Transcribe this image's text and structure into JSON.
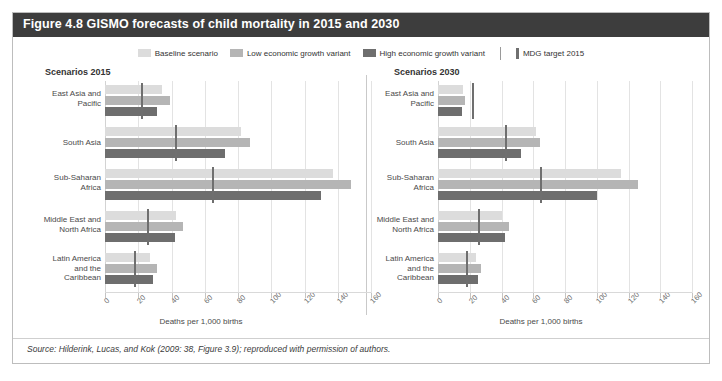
{
  "figure": {
    "title": "Figure 4.8 GISMO forecasts of child mortality in 2015 and 2030",
    "source": "Source: Hilderink, Lucas, and Kok (2009: 38, Figure 3.9); reproduced with permission of authors.",
    "title_bar_color": "#3d3d3d"
  },
  "legend": {
    "items": [
      {
        "label": "Baseline scenario",
        "color": "#dcdcdc",
        "type": "swatch"
      },
      {
        "label": "Low economic growth variant",
        "color": "#b5b5b5",
        "type": "swatch"
      },
      {
        "label": "High economic growth variant",
        "color": "#6e6e6e",
        "type": "swatch"
      },
      {
        "label": "MDG target 2015",
        "color": "#6f6f6f",
        "type": "rule"
      }
    ]
  },
  "chart_data": {
    "type": "bar",
    "orientation": "horizontal",
    "title": "Figure 4.8 GISMO forecasts of child mortality in 2015 and 2030",
    "xlabel": "Deaths per 1,000 births",
    "ylabel": "",
    "xlim": [
      0,
      160
    ],
    "xticks": [
      0,
      20,
      40,
      60,
      80,
      100,
      120,
      140,
      160
    ],
    "grid": true,
    "legend_position": "top-center",
    "categories": [
      "East Asia and\nPacific",
      "South Asia",
      "Sub-Saharan\nAfrica",
      "Middle East and\nNorth Africa",
      "Latin America\nand the\nCaribbean"
    ],
    "panels": [
      {
        "name": "Scenarios 2015",
        "heading": "Scenarios 2015",
        "xlabel": "Deaths per 1,000 births",
        "series": [
          {
            "name": "Baseline scenario",
            "color": "#dcdcdc",
            "values": [
              34,
              82,
              137,
              43,
              27
            ]
          },
          {
            "name": "Low economic growth variant",
            "color": "#b5b5b5",
            "values": [
              39,
              87,
              148,
              47,
              31
            ]
          },
          {
            "name": "High economic growth variant",
            "color": "#6e6e6e",
            "values": [
              31,
              72,
              130,
              42,
              29
            ]
          }
        ],
        "markers": {
          "name": "MDG target 2015",
          "color": "#6f6f6f",
          "values": [
            22,
            43,
            65,
            26,
            18
          ]
        }
      },
      {
        "name": "Scenarios 2030",
        "heading": "Scenarios 2030",
        "xlabel": "Deaths per 1,000 births",
        "series": [
          {
            "name": "Baseline scenario",
            "color": "#dcdcdc",
            "values": [
              16,
              62,
              115,
              40,
              24
            ]
          },
          {
            "name": "Low economic growth variant",
            "color": "#b5b5b5",
            "values": [
              17,
              64,
              126,
              45,
              27
            ]
          },
          {
            "name": "High economic growth variant",
            "color": "#6e6e6e",
            "values": [
              15,
              52,
              100,
              42,
              25
            ]
          }
        ],
        "markers": {
          "name": "MDG target 2015",
          "color": "#6f6f6f",
          "values": [
            22,
            43,
            65,
            26,
            18
          ]
        }
      }
    ]
  }
}
